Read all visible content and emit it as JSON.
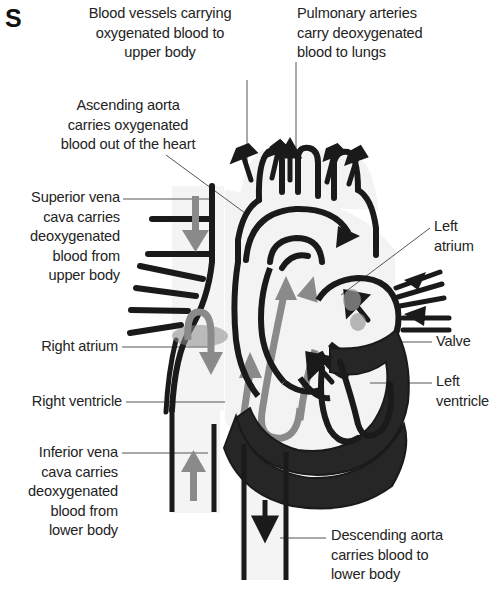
{
  "figure": {
    "panel_letter": "S",
    "background_color": "#ffffff",
    "ink_color": "#1a1a1a",
    "gray_arrow_color": "#8a8a8a",
    "vessel_fill_color": "#f2f2f2",
    "muscle_fill_color": "#262626"
  },
  "labels": [
    {
      "id": "upper-body-vessels",
      "text": "Blood vessels carrying\noxygenated blood to\nupper body",
      "align": "center"
    },
    {
      "id": "pulmonary-arteries",
      "text": "Pulmonary arteries\ncarry deoxygenated\nblood to lungs",
      "align": "left"
    },
    {
      "id": "ascending-aorta",
      "text": "Ascending aorta\ncarries oxygenated\nblood out of the heart",
      "align": "center"
    },
    {
      "id": "superior-vena-cava",
      "text": "Superior vena\ncava carries\ndeoxygenated\nblood from\nupper body",
      "align": "right"
    },
    {
      "id": "right-atrium",
      "text": "Right atrium",
      "align": "right"
    },
    {
      "id": "right-ventricle",
      "text": "Right ventricle",
      "align": "right"
    },
    {
      "id": "inferior-vena-cava",
      "text": "Inferior vena\ncava carries\ndeoxygenated\nblood from\nlower body",
      "align": "right"
    },
    {
      "id": "left-atrium",
      "text": "Left\natrium",
      "align": "left"
    },
    {
      "id": "valve",
      "text": "Valve",
      "align": "left"
    },
    {
      "id": "left-ventricle",
      "text": "Left\nventricle",
      "align": "left"
    },
    {
      "id": "descending-aorta",
      "text": "Descending aorta\ncarries blood to\nlower body",
      "align": "left"
    }
  ]
}
